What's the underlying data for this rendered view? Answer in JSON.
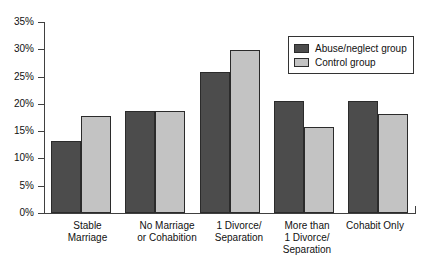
{
  "chart_data": {
    "type": "bar",
    "title": "",
    "subtitle": "",
    "xlabel": "",
    "ylabel": "",
    "ylim": [
      0,
      35
    ],
    "ytick_labels": [
      "35%",
      "30%",
      "25%",
      "20%",
      "15%",
      "10%",
      "5%",
      "0%"
    ],
    "ytick_values": [
      35,
      30,
      25,
      20,
      15,
      10,
      5,
      0
    ],
    "grid": false,
    "legend_position": "top-right",
    "categories": [
      "Stable\nMarriage",
      "No Marriage\nor Cohabition",
      "1 Divorce/\nSeparation",
      "More than\n1 Divorce/\nSeparation",
      "Cohabit Only"
    ],
    "series": [
      {
        "name": "Abuse/neglect group",
        "color": "#4c4c4c",
        "values": [
          13.2,
          18.6,
          25.8,
          20.6,
          20.5
        ]
      },
      {
        "name": "Control group",
        "color": "#c3c3c3",
        "values": [
          17.7,
          18.6,
          29.8,
          15.8,
          18.2
        ]
      }
    ]
  },
  "legend": {
    "items": [
      {
        "label": "Abuse/neglect group",
        "swatch": "dark"
      },
      {
        "label": "Control group",
        "swatch": "light"
      }
    ]
  },
  "axis": {
    "y_labels": [
      "35%",
      "30%",
      "25%",
      "20%",
      "15%",
      "10%",
      "5%",
      "0%"
    ]
  },
  "categories": {
    "c0": "Stable\nMarriage",
    "c1": "No Marriage\nor Cohabition",
    "c2": "1 Divorce/\nSeparation",
    "c3": "More than\n1 Divorce/\nSeparation",
    "c4": "Cohabit Only"
  }
}
